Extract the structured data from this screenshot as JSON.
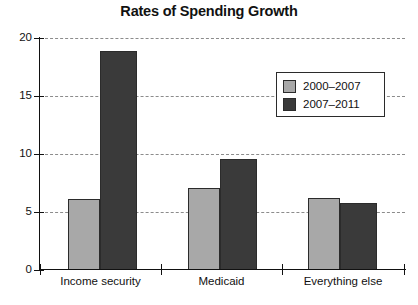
{
  "chart_data": {
    "type": "bar",
    "title": "Rates of Spending Growth",
    "xlabel": "",
    "ylabel": "",
    "ylim": [
      0,
      20
    ],
    "yticks": [
      0,
      5,
      10,
      15,
      20
    ],
    "ytick_labels": [
      "0",
      "5",
      "10",
      "15",
      "20"
    ],
    "grid": true,
    "legend_position": "upper right",
    "categories": [
      "Income security",
      "Medicaid",
      "Everything else"
    ],
    "series": [
      {
        "name": "2000–2007",
        "color": "#a8a8a8",
        "values": [
          6.1,
          7.1,
          6.2
        ]
      },
      {
        "name": "2007–2011",
        "color": "#3a3a3a",
        "values": [
          18.9,
          9.6,
          5.8
        ]
      }
    ]
  },
  "colors": {
    "series_light": "#a8a8a8",
    "series_dark": "#3a3a3a",
    "axis": "#111111",
    "grid": "#8c8c8c",
    "background": "#ffffff"
  }
}
